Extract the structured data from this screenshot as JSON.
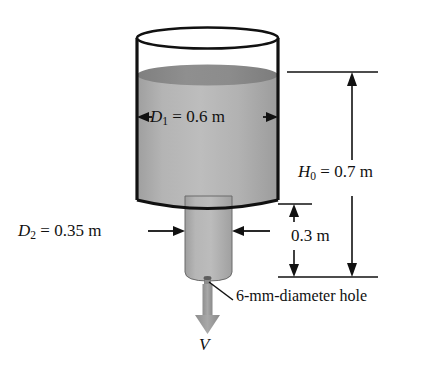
{
  "figure": {
    "type": "engineering-diagram",
    "background_color": "#ffffff",
    "line_color": "#111111"
  },
  "labels": {
    "diameter_top": {
      "symbol": "D",
      "subscript": "1",
      "equals": "=",
      "value": "0.6",
      "unit": "m",
      "full_text": "D1 = 0.6 m"
    },
    "diameter_bottom": {
      "symbol": "D",
      "subscript": "2",
      "equals": "=",
      "value": "0.35",
      "unit": "m",
      "full_text": "D2 = 0.35 m"
    },
    "height_total": {
      "symbol": "H",
      "subscript": "0",
      "equals": "=",
      "value": "0.7",
      "unit": "m",
      "full_text": "H0 = 0.7 m"
    },
    "height_lower": {
      "value": "0.3",
      "unit": "m",
      "full_text": "0.3 m"
    },
    "hole_callout": {
      "text": "6-mm-diameter hole"
    },
    "velocity": {
      "symbol": "V"
    }
  },
  "colors": {
    "water_light": "#b9b9b9",
    "water_mid": "#a9a9a9",
    "water_dark_surface": "#8b8b8b",
    "lower_cylinder": "#b0b0b0",
    "outline": "#111111",
    "arrow_gray": "#9a9a9a"
  },
  "geometry": {
    "tank_left_x": 137,
    "tank_right_x": 278,
    "tank_top_y": 28,
    "tank_bottom_y": 200,
    "water_surface_y": 75,
    "lower_left_x": 185,
    "lower_right_x": 232,
    "lower_bottom_y": 281,
    "dim_top_y": 72,
    "dim_mid_y": 204,
    "dim_bottom_y": 277
  }
}
